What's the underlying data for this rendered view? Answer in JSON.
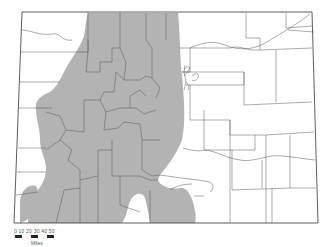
{
  "map": {
    "subject": "Colorado county map with shaded region",
    "colors": {
      "shaded_region": "#b3b3b3",
      "county_lines": "#555555",
      "background": "#ffffff",
      "border": "#333333"
    }
  },
  "scale_bar": {
    "ticks": "0 10 20 30 40 50",
    "units": "Miles"
  }
}
